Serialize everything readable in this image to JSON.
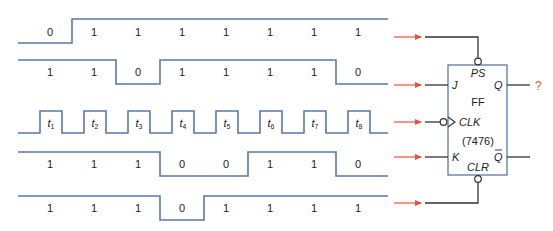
{
  "colors": {
    "waveform": "#5a78a8",
    "arrow": "#e8513a",
    "wire": "#333333",
    "box": "#5a78a8"
  },
  "signals": [
    {
      "name": "PS",
      "values": [
        "0",
        "1",
        "1",
        "1",
        "1",
        "1",
        "1",
        "1"
      ]
    },
    {
      "name": "J",
      "values": [
        "1",
        "1",
        "0",
        "1",
        "1",
        "1",
        "1",
        "0"
      ]
    },
    {
      "name": "CLK",
      "values": [
        "t1",
        "t2",
        "t3",
        "t4",
        "t5",
        "t6",
        "t7",
        "t8"
      ],
      "pulse_labels": [
        {
          "t": "t",
          "sub": "1"
        },
        {
          "t": "t",
          "sub": "2"
        },
        {
          "t": "t",
          "sub": "3"
        },
        {
          "t": "t",
          "sub": "4"
        },
        {
          "t": "t",
          "sub": "5"
        },
        {
          "t": "t",
          "sub": "6"
        },
        {
          "t": "t",
          "sub": "7"
        },
        {
          "t": "t",
          "sub": "8"
        }
      ]
    },
    {
      "name": "K",
      "values": [
        "1",
        "1",
        "1",
        "0",
        "0",
        "1",
        "1",
        "0"
      ]
    },
    {
      "name": "CLR",
      "values": [
        "1",
        "1",
        "1",
        "0",
        "1",
        "1",
        "1",
        "1"
      ]
    }
  ],
  "flipflop": {
    "label": "FF",
    "part": "(7476)",
    "pins": {
      "ps": "PS",
      "j": "J",
      "clk": "CLK",
      "k": "K",
      "clr": "CLR",
      "q": "Q",
      "qbar": "Q"
    },
    "output_unknown": "?"
  }
}
